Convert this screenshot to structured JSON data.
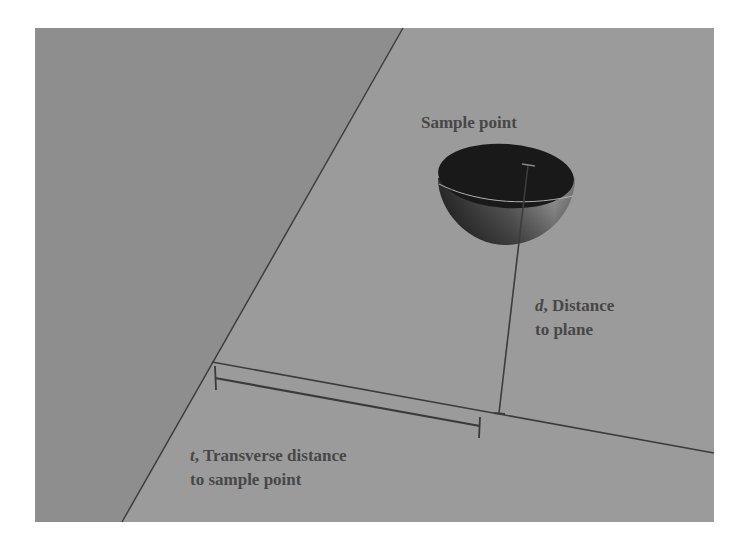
{
  "figure": {
    "type": "diagram",
    "colors": {
      "background": "#ffffff",
      "left_plane": "#8e8e8e",
      "right_plane": "#9b9b9b",
      "lines": "#3c3c3c",
      "text": "#474747",
      "hemisphere_inner": "#1a1a1a",
      "hemisphere_outer": "#6a6a6a"
    }
  },
  "labels": {
    "sample_point": "Sample point",
    "distance_var": "d",
    "distance_line1_rest": ", Distance",
    "distance_line2": "to plane",
    "transverse_var": "t",
    "transverse_line1_rest": ", Transverse distance",
    "transverse_line2": "to sample point"
  }
}
